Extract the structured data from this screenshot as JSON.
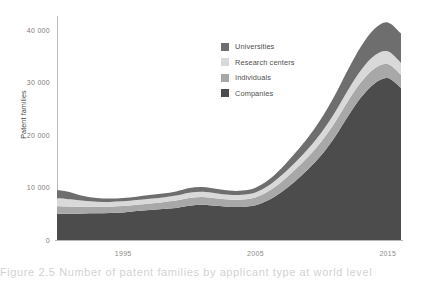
{
  "chart_data": {
    "type": "area",
    "title": "",
    "subtitle": "",
    "xlabel": "",
    "ylabel": "Patent families",
    "stacked": true,
    "grid": false,
    "legend_position": "inside-top-right",
    "xlim": [
      1990,
      2016
    ],
    "ylim": [
      0,
      43000
    ],
    "xticks": [
      1995,
      2005,
      2015
    ],
    "xticklabels": [
      "1995",
      "2005",
      "2015"
    ],
    "yticks": [
      0,
      10000,
      20000,
      30000,
      40000
    ],
    "yticklabels": [
      "0",
      "10 000",
      "20 000",
      "30 000",
      "40 000"
    ],
    "x": [
      1990,
      1991,
      1992,
      1993,
      1994,
      1995,
      1996,
      1997,
      1998,
      1999,
      2000,
      2001,
      2002,
      2003,
      2004,
      2005,
      2006,
      2007,
      2008,
      2009,
      2010,
      2011,
      2012,
      2013,
      2014,
      2015,
      2016
    ],
    "series": [
      {
        "name": "Companies",
        "color": "#4c4c4c",
        "values": [
          5000,
          5000,
          5050,
          5100,
          5150,
          5250,
          5500,
          5700,
          5900,
          6100,
          6500,
          6700,
          6500,
          6300,
          6300,
          6600,
          7600,
          9200,
          11200,
          13500,
          16200,
          19600,
          23600,
          27200,
          29800,
          30800,
          28900
        ]
      },
      {
        "name": "Individuals",
        "color": "#a8a8a8",
        "values": [
          1400,
          1350,
          1300,
          1250,
          1200,
          1200,
          1200,
          1250,
          1300,
          1400,
          1500,
          1500,
          1450,
          1400,
          1400,
          1500,
          1700,
          1950,
          2200,
          2400,
          2600,
          2750,
          2850,
          2900,
          2850,
          2700,
          2550
        ]
      },
      {
        "name": "Research centers",
        "color": "#d9d9d9",
        "values": [
          1550,
          1400,
          1100,
          950,
          900,
          900,
          900,
          900,
          900,
          950,
          1000,
          1000,
          950,
          900,
          900,
          950,
          1050,
          1200,
          1350,
          1500,
          1700,
          1900,
          2100,
          2300,
          2450,
          2400,
          2250
        ]
      },
      {
        "name": "Universities",
        "color": "#6e6e6e",
        "values": [
          1550,
          1350,
          900,
          700,
          650,
          650,
          650,
          700,
          750,
          800,
          900,
          900,
          850,
          800,
          800,
          900,
          1100,
          1400,
          1800,
          2200,
          2700,
          3300,
          3900,
          4500,
          5100,
          5500,
          5600
        ]
      }
    ],
    "annotations": []
  },
  "legend": {
    "items": [
      {
        "label": "Universities",
        "color": "#6e6e6e"
      },
      {
        "label": "Research centers",
        "color": "#d9d9d9"
      },
      {
        "label": "Individuals",
        "color": "#a8a8a8"
      },
      {
        "label": "Companies",
        "color": "#4c4c4c"
      }
    ]
  },
  "caption": {
    "text": "Figure 2.5 Number of patent families by applicant type at world level"
  }
}
